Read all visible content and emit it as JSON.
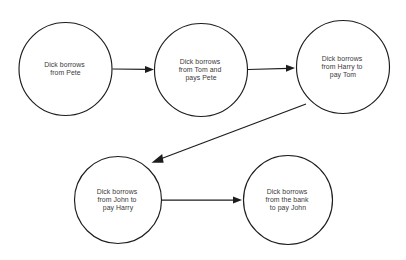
{
  "diagram": {
    "background_color": "#ffffff",
    "stroke_color": "#1d1d1d",
    "text_color": "#3a3a3a",
    "nodes": [
      {
        "id": "node-1",
        "name": "borrows-from-pete",
        "lines": [
          "Dick borrows",
          "from Pete"
        ],
        "cx": 65.5,
        "cy": 69,
        "r": 46.5
      },
      {
        "id": "node-2",
        "name": "borrows-from-tom-pays-pete",
        "lines": [
          "Dick borrows",
          "from Tom and",
          "pays Pete"
        ],
        "cx": 201,
        "cy": 70,
        "r": 46.5
      },
      {
        "id": "node-3",
        "name": "borrows-from-harry-pays-tom",
        "lines": [
          "Dick borrows",
          "from Harry to",
          "pay Tom"
        ],
        "cx": 343,
        "cy": 67,
        "r": 46.5
      },
      {
        "id": "node-4",
        "name": "borrows-from-john-pays-harry",
        "lines": [
          "Dick borrows",
          "from John to",
          "pay Harry"
        ],
        "cx": 118,
        "cy": 200,
        "r": 43.5
      },
      {
        "id": "node-5",
        "name": "borrows-from-bank-pays-john",
        "lines": [
          "Dick borrows",
          "from the bank",
          "to pay John"
        ],
        "cx": 288,
        "cy": 200,
        "r": 44.5
      }
    ],
    "edges": [
      {
        "id": "edge-1",
        "name": "edge-pete-to-tom",
        "from": "node-1",
        "to": "node-2",
        "x1": 112.5,
        "y1": 69,
        "x2": 154,
        "y2": 69.5,
        "direction": "right"
      },
      {
        "id": "edge-2",
        "name": "edge-tom-to-harry",
        "from": "node-2",
        "to": "node-3",
        "x1": 248,
        "y1": 69.5,
        "x2": 295,
        "y2": 68,
        "direction": "right"
      },
      {
        "id": "edge-3",
        "name": "edge-harry-to-john",
        "from": "node-3",
        "to": "node-4",
        "x1": 306,
        "y1": 104,
        "x2": 152,
        "y2": 163,
        "direction": "down-left"
      },
      {
        "id": "edge-4",
        "name": "edge-john-to-bank",
        "from": "node-4",
        "to": "node-5",
        "x1": 161,
        "y1": 200,
        "x2": 242,
        "y2": 200,
        "direction": "right"
      }
    ]
  }
}
